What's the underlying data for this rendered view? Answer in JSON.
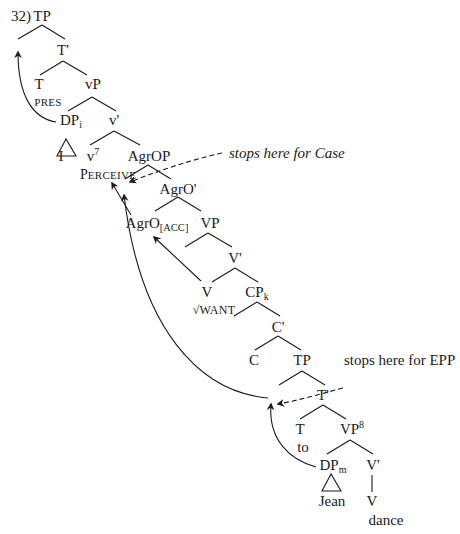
{
  "example_number": "32)",
  "nodes": {
    "tp_root": "TP",
    "t_bar": "T'",
    "t": "T",
    "pres": "PRES",
    "vp_little": "vP",
    "dp_i": "DP",
    "dp_i_index": "i",
    "v_bar_little": "v'",
    "i_pronoun": "I",
    "v_little": "v",
    "v_little_sup": "7",
    "perceive_p": "P",
    "perceive_rest": "ERCEIVE",
    "agrop": "AgrOP",
    "agro_bar": "AgrO'",
    "agro": "AgrO",
    "agro_sub": "[ACC]",
    "vp_big": "VP",
    "v_bar_big": "V'",
    "v_big": "V",
    "want": "√WANT",
    "cp": "CP",
    "cp_index": "k",
    "c_bar": "C'",
    "c": "C",
    "tp_embedded": "TP",
    "t_bar_embedded": "T'",
    "t_embedded": "T",
    "to": "to",
    "vp_embedded": "VP",
    "vp_embedded_sup": "8",
    "dp_m": "DP",
    "dp_m_index": "m",
    "v_bar_embedded": "V'",
    "jean": "Jean",
    "v_embedded": "V",
    "dance": "dance"
  },
  "annotations": {
    "case": "stops here for Case",
    "epp": "stops here for EPP"
  },
  "colors": {
    "ink": "#1a1a1a",
    "background": "#ffffff"
  }
}
